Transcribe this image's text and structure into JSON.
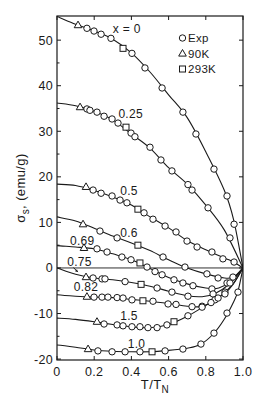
{
  "chart_data": {
    "type": "line",
    "title": "",
    "xlabel": "T/T_N",
    "ylabel": "σ_s, (emu/g)",
    "xlim": [
      0,
      1.0
    ],
    "ylim": [
      -20.2,
      55.3
    ],
    "xticks": [
      0,
      0.2,
      0.4,
      0.6,
      0.8,
      1.0
    ],
    "xtick_labels": [
      "0",
      "0.2",
      "0.4",
      "0.6",
      "0.8",
      "1.0"
    ],
    "yticks": [
      -20,
      -10,
      0,
      10,
      20,
      30,
      40,
      50
    ],
    "ytick_labels": [
      "-20",
      "-10",
      "0",
      "10",
      "20",
      "30",
      "40",
      "50"
    ],
    "yminor_ticks": [
      -15,
      -5,
      5,
      15,
      25,
      35,
      45
    ],
    "grid": false,
    "zero_line": true,
    "legend_position": "upper right",
    "legend": [
      {
        "marker": "circle",
        "code": "o",
        "label": "Exp"
      },
      {
        "marker": "triangle",
        "code": "t",
        "label": "90K"
      },
      {
        "marker": "square",
        "code": "s",
        "label": "293K"
      }
    ],
    "series": [
      {
        "name": "x = 0",
        "label": {
          "text": "x = 0",
          "x": 0.3,
          "y": 51.5
        },
        "curve": [
          [
            0,
            55.2
          ],
          [
            0.1,
            53.5
          ],
          [
            0.2,
            52.0
          ],
          [
            0.3,
            50.2
          ],
          [
            0.4,
            47.2
          ],
          [
            0.5,
            43.0
          ],
          [
            0.6,
            38.0
          ],
          [
            0.7,
            33.0
          ],
          [
            0.8,
            25.5
          ],
          [
            0.9,
            17.0
          ],
          [
            0.95,
            10.5
          ],
          [
            1.0,
            0
          ]
        ],
        "points": [
          [
            0.113,
            53.3,
            "t"
          ],
          [
            0.161,
            52.6,
            "o"
          ],
          [
            0.199,
            52.0,
            "o"
          ],
          [
            0.237,
            51.3,
            "o"
          ],
          [
            0.29,
            50.4,
            "o"
          ],
          [
            0.355,
            48.2,
            "s"
          ],
          [
            0.403,
            47.1,
            "o"
          ],
          [
            0.473,
            43.9,
            "o"
          ],
          [
            0.565,
            39.5,
            "o"
          ],
          [
            0.677,
            34.2,
            "o"
          ],
          [
            0.747,
            29.4,
            "o"
          ],
          [
            0.844,
            21.7,
            "o"
          ],
          [
            0.914,
            15.8,
            "o"
          ],
          [
            0.952,
            9.6,
            "o"
          ]
        ]
      },
      {
        "name": "x = 0.25",
        "label": {
          "text": "0.25",
          "x": 0.33,
          "y": 32.9
        },
        "curve": [
          [
            0,
            36.2
          ],
          [
            0.1,
            35.6
          ],
          [
            0.2,
            34.4
          ],
          [
            0.3,
            32.5
          ],
          [
            0.4,
            29.4
          ],
          [
            0.5,
            26.3
          ],
          [
            0.6,
            22.0
          ],
          [
            0.7,
            18.4
          ],
          [
            0.8,
            13.8
          ],
          [
            0.9,
            8.3
          ],
          [
            1.0,
            0
          ]
        ],
        "points": [
          [
            0.124,
            35.3,
            "t"
          ],
          [
            0.161,
            34.9,
            "o"
          ],
          [
            0.177,
            34.6,
            "o"
          ],
          [
            0.215,
            34.2,
            "o"
          ],
          [
            0.253,
            33.3,
            "o"
          ],
          [
            0.296,
            32.7,
            "o"
          ],
          [
            0.328,
            31.8,
            "o"
          ],
          [
            0.371,
            30.9,
            "s"
          ],
          [
            0.398,
            29.6,
            "o"
          ],
          [
            0.419,
            28.8,
            "o"
          ],
          [
            0.5,
            26.5,
            "o"
          ],
          [
            0.559,
            23.7,
            "o"
          ],
          [
            0.618,
            21.3,
            "o"
          ],
          [
            0.704,
            18.3,
            "o"
          ],
          [
            0.726,
            17.1,
            "o"
          ],
          [
            0.812,
            13.2,
            "o"
          ],
          [
            0.93,
            6.6,
            "o"
          ]
        ]
      },
      {
        "name": "x = 0.5",
        "label": {
          "text": "0.5",
          "x": 0.34,
          "y": 16.0
        },
        "curve": [
          [
            0,
            18.4
          ],
          [
            0.1,
            18.1
          ],
          [
            0.2,
            17.0
          ],
          [
            0.3,
            15.6
          ],
          [
            0.4,
            13.8
          ],
          [
            0.5,
            11.2
          ],
          [
            0.6,
            8.8
          ],
          [
            0.7,
            6.0
          ],
          [
            0.8,
            4.0
          ],
          [
            0.9,
            2.2
          ],
          [
            0.95,
            1.3
          ],
          [
            1.0,
            0
          ]
        ],
        "points": [
          [
            0.156,
            17.8,
            "t"
          ],
          [
            0.194,
            17.1,
            "o"
          ],
          [
            0.237,
            16.4,
            "o"
          ],
          [
            0.296,
            15.8,
            "o"
          ],
          [
            0.339,
            14.9,
            "o"
          ],
          [
            0.376,
            14.3,
            "o"
          ],
          [
            0.435,
            12.9,
            "s"
          ],
          [
            0.468,
            12.1,
            "o"
          ],
          [
            0.516,
            10.7,
            "o"
          ],
          [
            0.581,
            9.2,
            "o"
          ],
          [
            0.64,
            7.9,
            "o"
          ],
          [
            0.699,
            5.9,
            "o"
          ],
          [
            0.753,
            4.6,
            "o"
          ],
          [
            0.833,
            3.5,
            "o"
          ],
          [
            0.892,
            2.0,
            "o"
          ],
          [
            0.952,
            1.3,
            "o"
          ]
        ]
      },
      {
        "name": "x = 0.6",
        "label": {
          "text": "0.6",
          "x": 0.34,
          "y": 6.8
        },
        "curve": [
          [
            0,
            11.2
          ],
          [
            0.1,
            10.3
          ],
          [
            0.2,
            8.7
          ],
          [
            0.3,
            7.0
          ],
          [
            0.4,
            5.5
          ],
          [
            0.5,
            3.8
          ],
          [
            0.6,
            1.8
          ],
          [
            0.7,
            0.0
          ],
          [
            0.8,
            -1.3
          ],
          [
            0.9,
            -2.2
          ],
          [
            0.95,
            -2.0
          ],
          [
            1.0,
            0
          ]
        ],
        "points": [
          [
            0.14,
            9.6,
            "t"
          ],
          [
            0.231,
            8.1,
            "o"
          ],
          [
            0.323,
            6.6,
            "o"
          ],
          [
            0.435,
            5.0,
            "s"
          ],
          [
            0.57,
            2.4,
            "o"
          ],
          [
            0.688,
            0.2,
            "o"
          ],
          [
            0.806,
            -1.3,
            "o"
          ],
          [
            0.866,
            -2.2,
            "o"
          ],
          [
            0.946,
            -2.0,
            "o"
          ]
        ]
      },
      {
        "name": "x = 0.69",
        "label": {
          "text": "0.69",
          "x": 0.07,
          "y": 5.0
        },
        "curve": [
          [
            0,
            4.9
          ],
          [
            0.1,
            4.6
          ],
          [
            0.2,
            4.2
          ],
          [
            0.3,
            3.1
          ],
          [
            0.4,
            1.8
          ],
          [
            0.5,
            -0.1
          ],
          [
            0.6,
            -2.1
          ],
          [
            0.7,
            -3.5
          ],
          [
            0.8,
            -4.4
          ],
          [
            0.87,
            -4.4
          ],
          [
            0.93,
            -3.0
          ],
          [
            1.0,
            0
          ]
        ],
        "points": [
          [
            0.145,
            4.4,
            "t"
          ],
          [
            0.215,
            4.2,
            "o"
          ],
          [
            0.269,
            3.5,
            "o"
          ],
          [
            0.349,
            2.4,
            "o"
          ],
          [
            0.398,
            1.8,
            "o"
          ],
          [
            0.446,
            1.1,
            "s"
          ],
          [
            0.484,
            0.2,
            "o"
          ],
          [
            0.527,
            -0.8,
            "o"
          ],
          [
            0.565,
            -1.5,
            "o"
          ],
          [
            0.629,
            -2.6,
            "o"
          ],
          [
            0.677,
            -3.3,
            "o"
          ],
          [
            0.731,
            -3.9,
            "o"
          ],
          [
            0.833,
            -4.6,
            "o"
          ],
          [
            0.914,
            -3.3,
            "o"
          ]
        ]
      },
      {
        "name": "x = 0.75",
        "label": {
          "text": "0.75",
          "x": 0.055,
          "y": 0.5,
          "arrow": {
            "from": [
              0.088,
              0.1
            ],
            "to": [
              0.112,
              -0.9
            ]
          }
        },
        "curve": [
          [
            0,
            0
          ],
          [
            0.1,
            -1.4
          ],
          [
            0.2,
            -2.2
          ],
          [
            0.3,
            -2.6
          ],
          [
            0.4,
            -3.2
          ],
          [
            0.5,
            -4.0
          ],
          [
            0.6,
            -5.1
          ],
          [
            0.7,
            -6.1
          ],
          [
            0.78,
            -6.3
          ],
          [
            0.85,
            -5.6
          ],
          [
            0.93,
            -3.4
          ],
          [
            1.0,
            0
          ]
        ],
        "points": [
          [
            0.156,
            -2.0,
            "t"
          ],
          [
            0.194,
            -2.2,
            "o"
          ],
          [
            0.242,
            -2.4,
            "o"
          ],
          [
            0.258,
            -2.4,
            "o"
          ],
          [
            0.366,
            -3.0,
            "o"
          ],
          [
            0.452,
            -3.6,
            "s"
          ],
          [
            0.538,
            -4.4,
            "o"
          ],
          [
            0.618,
            -5.3,
            "o"
          ],
          [
            0.704,
            -6.2,
            "o"
          ],
          [
            0.839,
            -5.7,
            "o"
          ],
          [
            0.93,
            -3.3,
            "o"
          ]
        ]
      },
      {
        "name": "x = 0.82",
        "label": {
          "text": "0.82",
          "x": 0.09,
          "y": -5.0
        },
        "curve": [
          [
            0,
            -5.9
          ],
          [
            0.1,
            -6.2
          ],
          [
            0.2,
            -6.4
          ],
          [
            0.3,
            -6.5
          ],
          [
            0.4,
            -6.9
          ],
          [
            0.5,
            -7.3
          ],
          [
            0.6,
            -7.8
          ],
          [
            0.7,
            -8.4
          ],
          [
            0.77,
            -8.5
          ],
          [
            0.83,
            -7.6
          ],
          [
            0.9,
            -5.4
          ],
          [
            0.95,
            -3.3
          ],
          [
            1.0,
            0
          ]
        ],
        "points": [
          [
            0.161,
            -6.3,
            "t"
          ],
          [
            0.199,
            -6.4,
            "o"
          ],
          [
            0.242,
            -6.4,
            "o"
          ],
          [
            0.274,
            -6.4,
            "o"
          ],
          [
            0.323,
            -6.5,
            "o"
          ],
          [
            0.355,
            -6.6,
            "o"
          ],
          [
            0.403,
            -7.0,
            "o"
          ],
          [
            0.462,
            -7.2,
            "s"
          ],
          [
            0.516,
            -7.3,
            "o"
          ],
          [
            0.597,
            -7.9,
            "o"
          ],
          [
            0.64,
            -8.0,
            "o"
          ],
          [
            0.726,
            -8.5,
            "o"
          ],
          [
            0.78,
            -8.4,
            "o"
          ],
          [
            0.849,
            -7.0,
            "o"
          ],
          [
            0.903,
            -5.3,
            "o"
          ]
        ]
      },
      {
        "name": "x = 1.5",
        "label": {
          "text": "1.5",
          "x": 0.34,
          "y": -11.4
        },
        "curve": [
          [
            0,
            -11.0
          ],
          [
            0.1,
            -11.3
          ],
          [
            0.2,
            -11.8
          ],
          [
            0.3,
            -12.4
          ],
          [
            0.4,
            -12.9
          ],
          [
            0.5,
            -13.1
          ],
          [
            0.6,
            -12.4
          ],
          [
            0.7,
            -10.6
          ],
          [
            0.8,
            -8.2
          ],
          [
            0.9,
            -5.6
          ],
          [
            0.95,
            -3.4
          ],
          [
            1.0,
            0
          ]
        ],
        "points": [
          [
            0.215,
            -11.8,
            "t"
          ],
          [
            0.253,
            -12.3,
            "o"
          ],
          [
            0.323,
            -12.5,
            "o"
          ],
          [
            0.355,
            -12.7,
            "o"
          ],
          [
            0.403,
            -12.9,
            "o"
          ],
          [
            0.446,
            -12.9,
            "o"
          ],
          [
            0.489,
            -13.1,
            "o"
          ],
          [
            0.538,
            -13.1,
            "o"
          ],
          [
            0.591,
            -12.5,
            "o"
          ],
          [
            0.629,
            -11.8,
            "s"
          ],
          [
            0.704,
            -10.5,
            "o"
          ],
          [
            0.78,
            -8.6,
            "o"
          ],
          [
            0.828,
            -7.6,
            "o"
          ],
          [
            0.866,
            -6.6,
            "o"
          ],
          [
            0.903,
            -5.7,
            "o"
          ]
        ]
      },
      {
        "name": "x = 1.0",
        "label": {
          "text": "1.0",
          "x": 0.38,
          "y": -17.5
        },
        "curve": [
          [
            0,
            -16.9
          ],
          [
            0.1,
            -17.4
          ],
          [
            0.2,
            -18.0
          ],
          [
            0.3,
            -18.3
          ],
          [
            0.4,
            -18.4
          ],
          [
            0.5,
            -18.4
          ],
          [
            0.6,
            -18.1
          ],
          [
            0.7,
            -17.6
          ],
          [
            0.77,
            -16.8
          ],
          [
            0.84,
            -14.5
          ],
          [
            0.9,
            -11.2
          ],
          [
            0.95,
            -7.4
          ],
          [
            0.975,
            -4.8
          ],
          [
            1.0,
            0
          ]
        ],
        "points": [
          [
            0.167,
            -17.8,
            "t"
          ],
          [
            0.22,
            -18.2,
            "o"
          ],
          [
            0.296,
            -18.4,
            "o"
          ],
          [
            0.366,
            -18.4,
            "o"
          ],
          [
            0.446,
            -18.4,
            "o"
          ],
          [
            0.511,
            -18.4,
            "s"
          ],
          [
            0.581,
            -18.2,
            "o"
          ],
          [
            0.677,
            -17.8,
            "o"
          ],
          [
            0.774,
            -16.7,
            "o"
          ],
          [
            0.844,
            -14.3,
            "o"
          ],
          [
            0.914,
            -9.9,
            "o"
          ],
          [
            0.973,
            -5.3,
            "o"
          ]
        ]
      }
    ]
  },
  "axis_label_parts": {
    "x": {
      "main": "T/T",
      "sub": "N"
    },
    "y": {
      "main": "σ",
      "sub": "s",
      "rest": ", (emu/g)"
    }
  }
}
